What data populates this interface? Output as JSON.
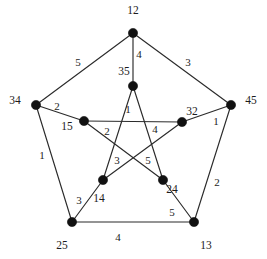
{
  "figure": {
    "title": "",
    "type": "petersen-graph",
    "background_color": "#ffffff",
    "edge_color": "#2b2b2b",
    "vertex_color": "#111111",
    "text_color": "#1c1c1c"
  },
  "vertices": {
    "outer": [
      {
        "id": "o-top",
        "label": "12",
        "x": 133,
        "y": 33,
        "label_x": 133,
        "label_y": 11
      },
      {
        "id": "o-left",
        "label": "34",
        "x": 36,
        "y": 105,
        "label_x": 15,
        "label_y": 101
      },
      {
        "id": "o-right",
        "label": "45",
        "x": 231,
        "y": 105,
        "label_x": 251,
        "label_y": 101
      },
      {
        "id": "o-bottom-left",
        "label": "25",
        "x": 72,
        "y": 222,
        "label_x": 62,
        "label_y": 246
      },
      {
        "id": "o-bottom-right",
        "label": "13",
        "x": 194,
        "y": 222,
        "label_x": 206,
        "label_y": 246
      }
    ],
    "inner": [
      {
        "id": "i-top",
        "label": "35",
        "x": 133,
        "y": 86,
        "label_x": 124,
        "label_y": 72
      },
      {
        "id": "i-left",
        "label": "15",
        "x": 84,
        "y": 121,
        "label_x": 67,
        "label_y": 127
      },
      {
        "id": "i-right",
        "label": "32",
        "x": 182,
        "y": 122,
        "label_x": 192,
        "label_y": 112
      },
      {
        "id": "i-bottom-left",
        "label": "14",
        "x": 103,
        "y": 180,
        "label_x": 99,
        "label_y": 199
      },
      {
        "id": "i-bottom-right",
        "label": "24",
        "x": 163,
        "y": 180,
        "label_x": 172,
        "label_y": 190
      }
    ]
  },
  "edges": [
    {
      "id": "e-outer-top-left",
      "from": "o-top",
      "to": "o-left",
      "label": "5",
      "label_x": 78,
      "label_y": 62
    },
    {
      "id": "e-outer-top-right",
      "from": "o-top",
      "to": "o-right",
      "label": "3",
      "label_x": 188,
      "label_y": 62
    },
    {
      "id": "e-outer-left-bl",
      "from": "o-left",
      "to": "o-bottom-left",
      "label": "1",
      "label_x": 42,
      "label_y": 155
    },
    {
      "id": "e-outer-right-br",
      "from": "o-right",
      "to": "o-bottom-right",
      "label": "2",
      "label_x": 217,
      "label_y": 182
    },
    {
      "id": "e-outer-bottom",
      "from": "o-bottom-left",
      "to": "o-bottom-right",
      "label": "4",
      "label_x": 118,
      "label_y": 237
    },
    {
      "id": "e-spoke-top",
      "from": "o-top",
      "to": "i-top",
      "label": "4",
      "label_x": 139,
      "label_y": 54
    },
    {
      "id": "e-spoke-left",
      "from": "o-left",
      "to": "i-left",
      "label": "2",
      "label_x": 57,
      "label_y": 106
    },
    {
      "id": "e-spoke-right",
      "from": "o-right",
      "to": "i-right",
      "label": "1",
      "label_x": 216,
      "label_y": 121
    },
    {
      "id": "e-spoke-bl",
      "from": "o-bottom-left",
      "to": "i-bottom-left",
      "label": "3",
      "label_x": 79,
      "label_y": 200
    },
    {
      "id": "e-spoke-br",
      "from": "o-bottom-right",
      "to": "i-bottom-right",
      "label": "5",
      "label_x": 172,
      "label_y": 212
    },
    {
      "id": "e-inner-top-bl",
      "from": "i-top",
      "to": "i-bottom-left",
      "label": "1",
      "label_x": 128,
      "label_y": 109
    },
    {
      "id": "e-inner-top-br",
      "from": "i-top",
      "to": "i-bottom-right",
      "label": "5",
      "label_x": 148,
      "label_y": 160
    },
    {
      "id": "e-inner-left-right",
      "from": "i-left",
      "to": "i-right",
      "label": "4",
      "label_x": 155,
      "label_y": 129
    },
    {
      "id": "e-inner-left-br",
      "from": "i-left",
      "to": "i-bottom-right",
      "label": "2",
      "label_x": 107,
      "label_y": 131
    },
    {
      "id": "e-inner-right-bl",
      "from": "i-right",
      "to": "i-bottom-left",
      "label": "3",
      "label_x": 117,
      "label_y": 160
    }
  ]
}
